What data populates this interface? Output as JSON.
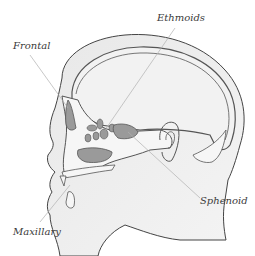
{
  "diagram": {
    "labels": [
      {
        "id": "frontal",
        "text": "Frontal"
      },
      {
        "id": "ethmoids",
        "text": "Ethmoids"
      },
      {
        "id": "sphenoid",
        "text": "Sphenoid"
      },
      {
        "id": "maxillary",
        "text": "Maxillary"
      }
    ],
    "colors": {
      "outline": "#3c3c3c",
      "skin_shade": "#e4e4e4",
      "skull_fill": "#f0f0f0",
      "sinus_fill": "#9a9a9a",
      "bone_fill": "#f6f6f6",
      "leader_line": "#b0b0b0"
    }
  }
}
